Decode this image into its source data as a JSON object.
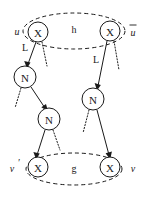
{
  "figure": {
    "background_color": "#ffffff",
    "ink_color": "#1a1a1a"
  },
  "nodes": [
    {
      "id": "x_top_left",
      "label": "X",
      "cx": 38,
      "cy": 32,
      "r": 10
    },
    {
      "id": "x_top_right",
      "label": "X",
      "cx": 110,
      "cy": 31,
      "r": 10
    },
    {
      "id": "n_left_upper",
      "label": "N",
      "cx": 25,
      "cy": 77,
      "r": 11
    },
    {
      "id": "n_left_lower",
      "label": "N",
      "cx": 49,
      "cy": 119,
      "r": 11
    },
    {
      "id": "n_right",
      "label": "N",
      "cx": 93,
      "cy": 99,
      "r": 11
    },
    {
      "id": "x_bot_left",
      "label": "X",
      "cx": 38,
      "cy": 167,
      "r": 10
    },
    {
      "id": "x_bot_right",
      "label": "X",
      "cx": 110,
      "cy": 167,
      "r": 10
    }
  ],
  "outer_labels": [
    {
      "id": "u",
      "text": "u",
      "x": 17,
      "y": 31,
      "prime": false,
      "bar": false
    },
    {
      "id": "u_bar",
      "text": "u",
      "x": 133,
      "y": 31,
      "prime": false,
      "bar": true
    },
    {
      "id": "v_prime",
      "text": "v",
      "x": 13,
      "y": 168,
      "prime": true,
      "bar": false
    },
    {
      "id": "v",
      "text": "v",
      "x": 133,
      "y": 168,
      "prime": false,
      "bar": false
    }
  ],
  "edge_labels": [
    {
      "id": "L_left",
      "text": "L",
      "x": 25,
      "y": 47
    },
    {
      "id": "L_right",
      "text": "L",
      "x": 96,
      "y": 59
    }
  ],
  "regions": [
    {
      "id": "region_h",
      "label": "h",
      "cx": 74,
      "cy": 31,
      "rx": 51,
      "ry": 18,
      "label_x": 74,
      "label_y": 29
    },
    {
      "id": "region_g",
      "label": "g",
      "cx": 74,
      "cy": 169,
      "rx": 48,
      "ry": 16,
      "label_x": 74,
      "label_y": 168
    }
  ],
  "edges": [
    {
      "id": "e_topleft_to_nleft",
      "from": "x_top_left",
      "to": "n_left_upper",
      "style": "solid",
      "arrow": true
    },
    {
      "id": "e_topleft_dotted",
      "from": "x_top_left",
      "to": "dangling-right-down",
      "style": "dotted",
      "arrow": false
    },
    {
      "id": "e_nleft_dotted",
      "from": "n_left_upper",
      "to": "dangling-left-down",
      "style": "dotted",
      "arrow": false
    },
    {
      "id": "e_nleft_to_nlower",
      "from": "n_left_upper",
      "to": "n_left_lower",
      "style": "solid",
      "arrow": true
    },
    {
      "id": "e_nlower_to_xbotleft",
      "from": "n_left_lower",
      "to": "x_bot_left",
      "style": "solid",
      "arrow": true
    },
    {
      "id": "e_nlower_dotted",
      "from": "n_left_lower",
      "to": "dangling-right-down",
      "style": "dotted",
      "arrow": false
    },
    {
      "id": "e_topright_to_nright",
      "from": "x_top_right",
      "to": "n_right",
      "style": "solid",
      "arrow": true
    },
    {
      "id": "e_topright_dotted",
      "from": "x_top_right",
      "to": "dangling-right-down",
      "style": "dotted",
      "arrow": false
    },
    {
      "id": "e_nright_dotted",
      "from": "n_right",
      "to": "dangling-left-down",
      "style": "dotted",
      "arrow": false
    },
    {
      "id": "e_nright_to_xbotright",
      "from": "n_right",
      "to": "x_bot_right",
      "style": "solid",
      "arrow": true
    }
  ]
}
